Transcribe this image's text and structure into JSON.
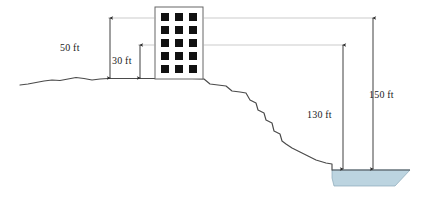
{
  "diagram": {
    "colors": {
      "outline": "#3c3c3c",
      "terrain": "#4a4a4a",
      "water_fill": "#bcd4e0",
      "water_edge": "#8aa8b8",
      "window_fill": "#111111",
      "building_fill": "#ffffff",
      "building_stroke": "#555555",
      "extension_line": "#9a9a9a",
      "dimension_line": "#3c3c3c",
      "text": "#1a1a1a"
    },
    "dimensions": [
      {
        "id": "50ft",
        "label": "50 ft",
        "from": "building-top",
        "to": "ground"
      },
      {
        "id": "30ft",
        "label": "30 ft",
        "from": "building-mid",
        "to": "ground"
      },
      {
        "id": "130ft",
        "label": "130 ft",
        "from": "building-mid",
        "to": "river"
      },
      {
        "id": "150ft",
        "label": "150 ft",
        "from": "building-top",
        "to": "river"
      }
    ],
    "building": {
      "name": "apartment-building",
      "window_columns": 3,
      "window_rows": 5,
      "window_count": 15
    },
    "features": [
      {
        "name": "ground-terrain"
      },
      {
        "name": "cliff-slope"
      },
      {
        "name": "river-water"
      }
    ]
  }
}
